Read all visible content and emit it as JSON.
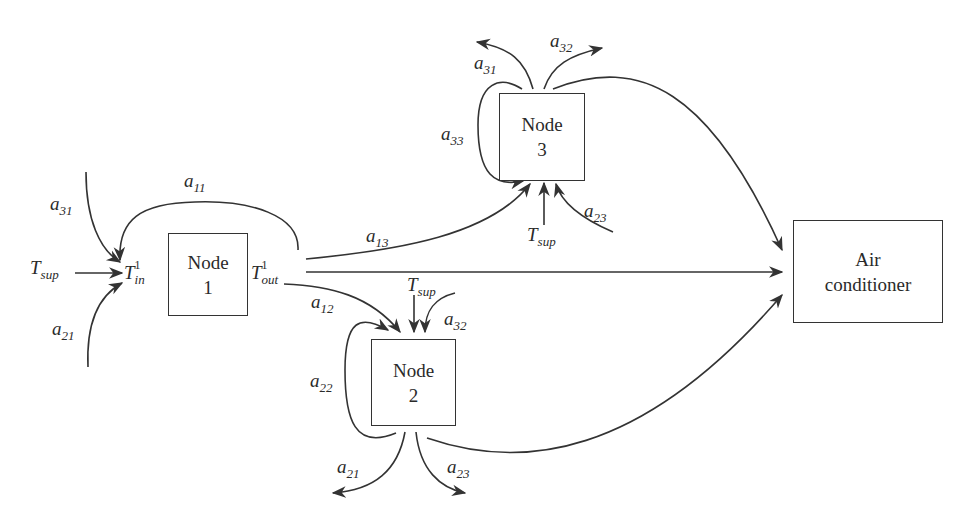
{
  "diagram": {
    "nodes": [
      {
        "id": "node1",
        "line1": "Node",
        "line2": "1"
      },
      {
        "id": "node2",
        "line1": "Node",
        "line2": "2"
      },
      {
        "id": "node3",
        "line1": "Node",
        "line2": "3"
      },
      {
        "id": "ac",
        "line1": "Air",
        "line2": "conditioner"
      }
    ],
    "labels": {
      "a11": {
        "base": "a",
        "sub": "11"
      },
      "a12": {
        "base": "a",
        "sub": "12"
      },
      "a13": {
        "base": "a",
        "sub": "13"
      },
      "a21_in": {
        "base": "a",
        "sub": "21"
      },
      "a21_out": {
        "base": "a",
        "sub": "21"
      },
      "a22": {
        "base": "a",
        "sub": "22"
      },
      "a23_out": {
        "base": "a",
        "sub": "23"
      },
      "a23_in": {
        "base": "a",
        "sub": "23"
      },
      "a31_in": {
        "base": "a",
        "sub": "31"
      },
      "a31_out": {
        "base": "a",
        "sub": "31"
      },
      "a32_out": {
        "base": "a",
        "sub": "32"
      },
      "a32_in": {
        "base": "a",
        "sub": "32"
      },
      "a33": {
        "base": "a",
        "sub": "33"
      },
      "tsup1": {
        "base": "T",
        "sub": "sup"
      },
      "tsup2": {
        "base": "T",
        "sub": "sup"
      },
      "tsup3": {
        "base": "T",
        "sub": "sup"
      },
      "tin": {
        "base": "T",
        "sup": "1",
        "sub": "in"
      },
      "tout": {
        "base": "T",
        "sup": "1",
        "sub": "out"
      }
    },
    "edges": [
      {
        "from": "Tsup",
        "to": "T_in^1"
      },
      {
        "from": "a31",
        "to": "T_in^1"
      },
      {
        "from": "a21",
        "to": "T_in^1"
      },
      {
        "from": "T_out^1",
        "to": "T_in^1",
        "label": "a11"
      },
      {
        "from": "T_out^1",
        "to": "node3",
        "label": "a13"
      },
      {
        "from": "T_out^1",
        "to": "node2",
        "label": "a12"
      },
      {
        "from": "T_out^1",
        "to": "ac"
      },
      {
        "from": "node3",
        "to": "node3",
        "label": "a33"
      },
      {
        "from": "node3",
        "to": "out",
        "label": "a31"
      },
      {
        "from": "node3",
        "to": "out",
        "label": "a32"
      },
      {
        "from": "node3",
        "to": "ac"
      },
      {
        "from": "Tsup",
        "to": "node3"
      },
      {
        "from": "a23",
        "to": "node3"
      },
      {
        "from": "node2",
        "to": "node2",
        "label": "a22"
      },
      {
        "from": "Tsup",
        "to": "node2"
      },
      {
        "from": "a32",
        "to": "node2"
      },
      {
        "from": "node2",
        "to": "out",
        "label": "a21"
      },
      {
        "from": "node2",
        "to": "out",
        "label": "a23"
      },
      {
        "from": "node2",
        "to": "ac"
      }
    ],
    "colors": {
      "stroke": "#333333",
      "background": "#ffffff"
    }
  }
}
